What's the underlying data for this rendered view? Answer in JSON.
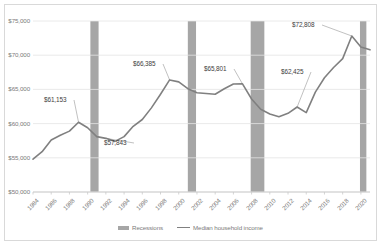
{
  "chart_data": {
    "type": "line",
    "title": "",
    "xlabel": "",
    "ylabel": "",
    "ylim": [
      50000,
      75000
    ],
    "ytick_values": [
      50000,
      55000,
      60000,
      65000,
      70000,
      75000
    ],
    "ytick_labels": [
      "$50,000",
      "$55,000",
      "$60,000",
      "$65,000",
      "$70,000",
      "$75,000"
    ],
    "xlim": [
      1984,
      2021
    ],
    "xtick_labels": [
      "1984",
      "1986",
      "1988",
      "1990",
      "1992",
      "1994",
      "1996",
      "1998",
      "2000",
      "2002",
      "2004",
      "2006",
      "2008",
      "2010",
      "2012",
      "2014",
      "2016",
      "2018",
      "2020"
    ],
    "grid": "horizontal",
    "legend_position": "bottom",
    "legend": [
      {
        "label": "Recessions",
        "type": "band",
        "color": "#a6a6a6"
      },
      {
        "label": "Median household income",
        "type": "line",
        "color": "#808080"
      }
    ],
    "series": [
      {
        "name": "Median household income",
        "color": "#808080",
        "x": [
          1984,
          1985,
          1986,
          1987,
          1988,
          1989,
          1990,
          1991,
          1992,
          1993,
          1994,
          1995,
          1996,
          1997,
          1998,
          1999,
          2000,
          2001,
          2002,
          2003,
          2004,
          2005,
          2006,
          2007,
          2008,
          2009,
          2010,
          2011,
          2012,
          2013,
          2014,
          2015,
          2016,
          2017,
          2018,
          2019,
          2020,
          2021
        ],
        "values": [
          54800,
          55900,
          57600,
          58300,
          58900,
          60200,
          59400,
          58100,
          57843,
          57400,
          58100,
          59600,
          60600,
          62300,
          64300,
          66385,
          66100,
          65100,
          64500,
          64400,
          64300,
          65100,
          65800,
          65801,
          63600,
          62100,
          61400,
          61000,
          61500,
          62425,
          61600,
          64600,
          66700,
          68200,
          69500,
          72808,
          71200,
          70784
        ]
      }
    ],
    "recession_bands": [
      {
        "start": 1990.3,
        "end": 1991.2,
        "label": "recession-1990"
      },
      {
        "start": 2001.0,
        "end": 2001.9,
        "label": "recession-2001"
      },
      {
        "start": 2007.9,
        "end": 2009.4,
        "label": "recession-2008"
      },
      {
        "start": 2019.9,
        "end": 2020.6,
        "label": "recession-2020"
      }
    ],
    "annotations": [
      {
        "text": "$61,153",
        "point_x": 1989,
        "point_y": 60200,
        "label_x": 44,
        "label_y": 96
      },
      {
        "text": "$57,843",
        "point_x": 1992,
        "point_y": 57843,
        "label_x": 104,
        "label_y": 139
      },
      {
        "text": "$66,385",
        "point_x": 1999,
        "point_y": 66385,
        "label_x": 133,
        "label_y": 60
      },
      {
        "text": "$65,801",
        "point_x": 2007,
        "point_y": 65801,
        "label_x": 204,
        "label_y": 65
      },
      {
        "text": "$62,425",
        "point_x": 2013,
        "point_y": 62425,
        "label_x": 281,
        "label_y": 68
      },
      {
        "text": "$72,808",
        "point_x": 2019,
        "point_y": 72808,
        "label_x": 292,
        "label_y": 21
      }
    ]
  }
}
